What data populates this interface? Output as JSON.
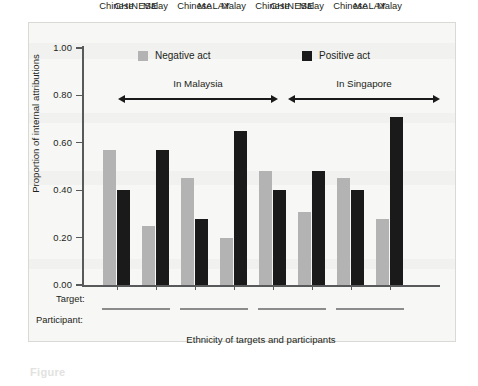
{
  "figure": {
    "caption_fragment": "Figure",
    "legend": [
      {
        "label": "Negative act",
        "color": "#b3b3b3",
        "icon": "square-swatch-grey"
      },
      {
        "label": "Positive act",
        "color": "#1a1a1a",
        "icon": "square-swatch-black"
      }
    ],
    "spans": [
      {
        "label": "In Malaysia"
      },
      {
        "label": "In Singapore"
      }
    ],
    "row_titles": {
      "target": "Target:",
      "participant": "Participant:"
    }
  },
  "chart_data": {
    "type": "bar",
    "title": "",
    "xlabel": "Ethnicity of targets and participants",
    "ylabel": "Proportion of internal attributions",
    "ylim": [
      0.0,
      1.0
    ],
    "ytick_labels": [
      "0.00",
      "0.20",
      "0.40",
      "0.60",
      "0.80",
      "1.00"
    ],
    "ytick_values": [
      0.0,
      0.2,
      0.4,
      0.6,
      0.8,
      1.0
    ],
    "grid": false,
    "legend_position": "top",
    "country_groups": [
      "In Malaysia",
      "In Singapore"
    ],
    "participant_groups": [
      "CHINESE",
      "MALAY",
      "CHINESE",
      "MALAY"
    ],
    "categories": [
      "Chinese",
      "Malay",
      "Chinese",
      "Malay",
      "Chinese",
      "Malay",
      "Chinese",
      "Malay"
    ],
    "series": [
      {
        "name": "Negative act",
        "color": "#b3b3b3",
        "values": [
          0.57,
          0.25,
          0.45,
          0.2,
          0.48,
          0.31,
          0.45,
          0.28
        ]
      },
      {
        "name": "Positive act",
        "color": "#1a1a1a",
        "values": [
          0.4,
          0.57,
          0.28,
          0.65,
          0.4,
          0.48,
          0.4,
          0.71
        ]
      }
    ]
  }
}
